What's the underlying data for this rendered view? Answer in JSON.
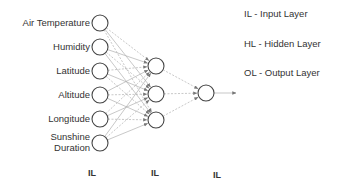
{
  "inputs": [
    {
      "label": "Air Temperature",
      "y": 23
    },
    {
      "label": "Humidity",
      "y": 47
    },
    {
      "label": "Latitude",
      "y": 71
    },
    {
      "label": "Altitude",
      "y": 95
    },
    {
      "label": "Longitude",
      "y": 119
    },
    {
      "label": "Sunshine Duration",
      "line1": "Sunshine",
      "line2": "Duration",
      "y": 143
    }
  ],
  "hidden": [
    {
      "y": 66
    },
    {
      "y": 94
    },
    {
      "y": 120
    }
  ],
  "output": {
    "y": 93
  },
  "layer_labels": [
    "IL",
    "IL",
    "IL"
  ],
  "legend": [
    {
      "text": "IL - Input Layer"
    },
    {
      "text": "HL - Hidden Layer"
    },
    {
      "text": "OL - Output  Layer"
    }
  ],
  "colors": {
    "node_stroke": "#444444",
    "edge": "#b0b0b0",
    "arrow": "#777777"
  }
}
